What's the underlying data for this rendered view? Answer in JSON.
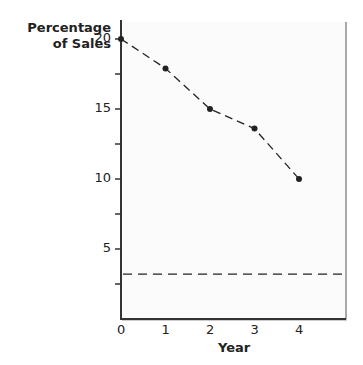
{
  "chart_data": {
    "type": "line",
    "title": "",
    "xlabel": "Year",
    "ylabel": "Percentage of Sales",
    "ylabel_lines": [
      "Percentage",
      "of Sales"
    ],
    "x": [
      0,
      1,
      2,
      3,
      4
    ],
    "series": [
      {
        "name": "Percentage of Sales",
        "values": [
          20,
          17.9,
          15,
          13.6,
          10
        ],
        "style": "dashed",
        "markers": true
      }
    ],
    "reference_lines": [
      {
        "orientation": "horizontal",
        "y": 3.2,
        "style": "dashed"
      }
    ],
    "x_ticks": [
      "0",
      "1",
      "2",
      "3",
      "4"
    ],
    "y_ticks": [
      "5",
      "10",
      "15",
      "20"
    ],
    "y_minor_ticks": [
      2.5,
      7.5,
      12.5,
      17.5
    ],
    "xlim": [
      0,
      5
    ],
    "ylim": [
      0,
      21.5
    ],
    "grid": false,
    "legend": "none"
  },
  "colors": {
    "line": "#222222",
    "axis": "#333333",
    "panel": "#fbfbfb",
    "border": "#aaaaaa"
  }
}
